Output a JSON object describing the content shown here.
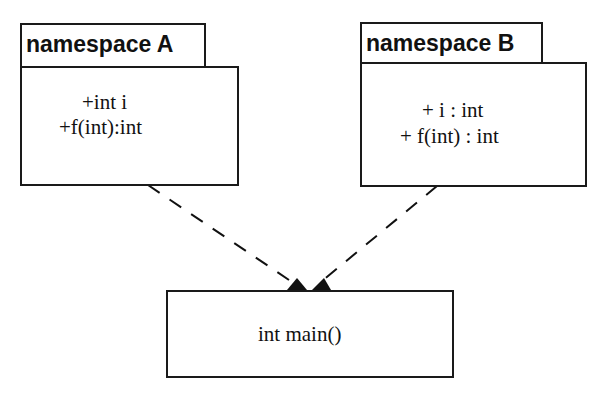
{
  "diagram": {
    "namespace_a": {
      "title": "namespace A",
      "members": [
        "+int i",
        "+f(int):int"
      ]
    },
    "namespace_b": {
      "title": "namespace B",
      "members": [
        "+ i : int",
        "+ f(int) : int"
      ]
    },
    "main": {
      "label": "int main()"
    },
    "edges": [
      {
        "from": "namespace A",
        "to": "int main()",
        "style": "dashed-arrow"
      },
      {
        "from": "namespace B",
        "to": "int main()",
        "style": "dashed-arrow"
      }
    ]
  }
}
